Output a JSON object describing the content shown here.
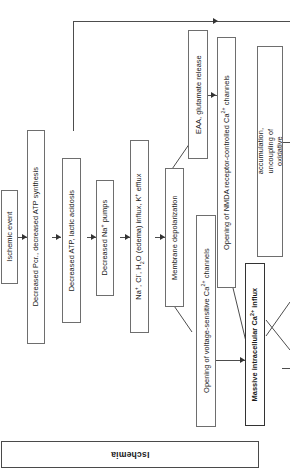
{
  "figure": {
    "kind": "flowchart",
    "orientation": "rotated-90-ccw",
    "banner_label": "Ischemia",
    "line_color": "#4d4d4d",
    "box_border_color": "#6e6e6e",
    "background": "#ffffff"
  },
  "nodes": [
    {
      "id": "ischemic-event",
      "label": "Ischemic event"
    },
    {
      "id": "decreased-pcr",
      "label": "Decreased Pcr., decreased ATP synthesis"
    },
    {
      "id": "decreased-atp",
      "label": "Decreased ATP, lactic acidosis"
    },
    {
      "id": "decreased-na-pumps",
      "label": "Decreased Na+ pumps"
    },
    {
      "id": "ion-fluxes",
      "label": "Na+, Cl-, H2O (edema) influx, K+ efflux"
    },
    {
      "id": "membrane-depol",
      "label": "Membrane depolarization"
    },
    {
      "id": "eaa-glutamate",
      "label": "EAA, glutamate release"
    },
    {
      "id": "voltage-ca-channels",
      "label": "Opening of voltage-sensitive Ca2+ channels"
    },
    {
      "id": "nmda-ca-channels",
      "label": "Opening of NMDA receptor-controlled Ca2+ channels"
    },
    {
      "id": "massive-ca-influx",
      "label": "Massive intracellular Ca2+ influx"
    },
    {
      "id": "mitochondrial",
      "label": "Mitochondrial accumulation, uncoupling of oxidative phosphorylation"
    }
  ]
}
